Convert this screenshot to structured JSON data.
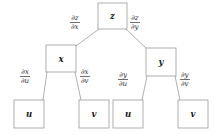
{
  "diagram": {
    "background_color": "#ffffff",
    "box_stroke_color": "#9b9b9b",
    "edge_stroke_color": "#9b9b9b",
    "text_color": "#1a1a1a",
    "nodes": [
      {
        "id": "z",
        "label": "z",
        "x": 98,
        "y": 3,
        "w": 29,
        "h": 26
      },
      {
        "id": "x",
        "label": "x",
        "x": 46,
        "y": 45,
        "w": 30,
        "h": 27
      },
      {
        "id": "y",
        "label": "y",
        "x": 146,
        "y": 48,
        "w": 30,
        "h": 28
      },
      {
        "id": "u1",
        "label": "u",
        "x": 14,
        "y": 100,
        "w": 30,
        "h": 28
      },
      {
        "id": "v1",
        "label": "v",
        "x": 79,
        "y": 100,
        "w": 30,
        "h": 28
      },
      {
        "id": "u2",
        "label": "u",
        "x": 113,
        "y": 100,
        "w": 30,
        "h": 28
      },
      {
        "id": "v2",
        "label": "v",
        "x": 178,
        "y": 100,
        "w": 30,
        "h": 28
      }
    ],
    "edges": [
      {
        "id": "z-x",
        "from": "z",
        "to": "x",
        "x1": 99,
        "y1": 29,
        "x2": 76,
        "y2": 46
      },
      {
        "id": "z-y",
        "from": "z",
        "to": "y",
        "x1": 126,
        "y1": 29,
        "x2": 147,
        "y2": 49
      },
      {
        "id": "x-u1",
        "from": "x",
        "to": "u1",
        "x1": 47,
        "y1": 72,
        "x2": 43,
        "y2": 100
      },
      {
        "id": "x-v1",
        "from": "x",
        "to": "v1",
        "x1": 75,
        "y1": 72,
        "x2": 81,
        "y2": 100
      },
      {
        "id": "y-u2",
        "from": "y",
        "to": "u2",
        "x1": 147,
        "y1": 76,
        "x2": 142,
        "y2": 100
      },
      {
        "id": "y-v2",
        "from": "y",
        "to": "v2",
        "x1": 175,
        "y1": 76,
        "x2": 180,
        "y2": 100
      }
    ],
    "edge_labels": [
      {
        "id": "dz-dx",
        "numerator": "∂z",
        "denominator": "∂x",
        "x": 70,
        "y": 15
      },
      {
        "id": "dz-dy",
        "numerator": "∂z",
        "denominator": "∂y",
        "x": 130,
        "y": 15
      },
      {
        "id": "dx-du",
        "numerator": "∂x",
        "denominator": "∂u",
        "x": 20,
        "y": 69
      },
      {
        "id": "dx-dv",
        "numerator": "∂x",
        "denominator": "∂v",
        "x": 80,
        "y": 69
      },
      {
        "id": "dy-du",
        "numerator": "∂y",
        "denominator": "∂u",
        "x": 118,
        "y": 72
      },
      {
        "id": "dy-dv",
        "numerator": "∂y",
        "denominator": "∂v",
        "x": 180,
        "y": 72
      }
    ]
  }
}
